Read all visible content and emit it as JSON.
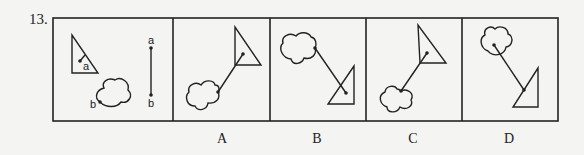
{
  "question": {
    "number": "13."
  },
  "frame": {
    "x": 53,
    "y": 18,
    "width": 505,
    "height": 103,
    "dividers": [
      173,
      270,
      366,
      462
    ],
    "stroke": "#222222"
  },
  "stem": {
    "triangle_label": "a",
    "cloud_label": "b",
    "segment_top_label": "a",
    "segment_bottom_label": "b"
  },
  "options": [
    {
      "label": "A",
      "x": 212
    },
    {
      "label": "B",
      "x": 307
    },
    {
      "label": "C",
      "x": 403
    },
    {
      "label": "D",
      "x": 499
    }
  ],
  "colors": {
    "background": "#f4f4f2",
    "ink": "#222222"
  }
}
